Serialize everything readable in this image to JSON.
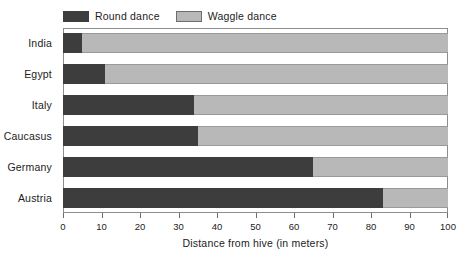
{
  "chart_data": {
    "type": "bar",
    "orientation": "horizontal",
    "stacked": true,
    "title": "",
    "xlabel": "Distance from hive  (in meters)",
    "ylabel": "",
    "xlim": [
      0,
      100
    ],
    "xticks": [
      0,
      10,
      20,
      30,
      40,
      50,
      60,
      70,
      80,
      90,
      100
    ],
    "xtick_labels": [
      "0",
      "10",
      "20",
      "30",
      "40",
      "50",
      "60",
      "70",
      "80",
      "90",
      "100"
    ],
    "grid": false,
    "legend_position": "top-left",
    "categories": [
      "India",
      "Egypt",
      "Italy",
      "Caucasus",
      "Germany",
      "Austria"
    ],
    "series": [
      {
        "name": "Round dance",
        "color": "#3d3d3d",
        "values": [
          5,
          11,
          34,
          35,
          65,
          83
        ]
      },
      {
        "name": "Waggle dance",
        "color": "#b8b8b8",
        "values": [
          95,
          89,
          66,
          65,
          35,
          17
        ]
      }
    ]
  },
  "legend": {
    "items": [
      {
        "label": "Round dance",
        "swatch": "round"
      },
      {
        "label": "Waggle dance",
        "swatch": "waggle"
      }
    ]
  },
  "axis": {
    "x_title": "Distance from hive  (in meters)"
  },
  "colors": {
    "round_dance": "#3d3d3d",
    "waggle_dance": "#b8b8b8",
    "frame": "#8d8d8d",
    "text": "#1c1c1c",
    "background": "#ffffff"
  }
}
